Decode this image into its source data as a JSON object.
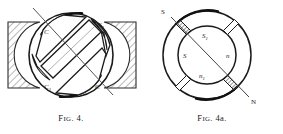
{
  "figures": [
    {
      "id": "fig-4",
      "caption_prefix": "F",
      "caption_smallcaps": "IG",
      "caption_suffix": ". 4.",
      "caption_full": "FIG. 4.",
      "labels": {
        "top_left": "C",
        "top_right_base": "C",
        "top_right_sub": "1",
        "bottom_left_base": "C",
        "bottom_left_sub": "1",
        "bottom_right": "C"
      },
      "description": "Circular laminated armature core with four curved pole pieces around a diagonal central band, set between two cross-hatched pole blocks, with an inclined axis line."
    },
    {
      "id": "fig-4a",
      "caption_prefix": "F",
      "caption_smallcaps": "IG",
      "caption_suffix": ". 4a.",
      "caption_full": "FIG. 4a.",
      "labels": {
        "axis_start": "S",
        "axis_end": "N",
        "inner_top_base": "S",
        "inner_top_sub": "1",
        "inner_left": "S",
        "inner_right": "n",
        "inner_bottom_base": "n",
        "inner_bottom_sub": "1"
      },
      "description": "Annular ring divided into four segments by four radial gaps; the two gaps on the inclined S-N axis are shaded, the other two are open."
    }
  ],
  "colors": {
    "ink": "#1b1b1b",
    "paper": "#ffffff",
    "hatch": "#6e6e6e",
    "shade": "#8a8a8a"
  }
}
